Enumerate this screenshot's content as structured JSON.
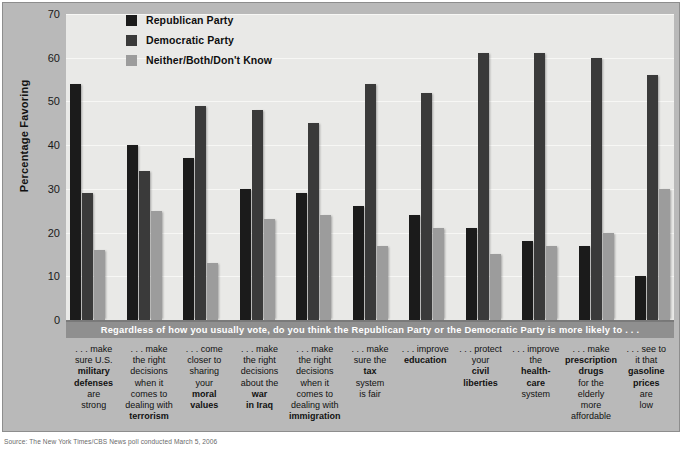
{
  "chart_data": {
    "type": "bar",
    "title": "",
    "question_banner": "Regardless of how you usually vote, do you think the Republican Party or the Democratic Party is more likely to . . .",
    "xlabel": "",
    "ylabel": "Percentage Favoring",
    "ylim": [
      0,
      70
    ],
    "yticks": [
      70,
      60,
      50,
      40,
      30,
      20,
      10,
      0
    ],
    "grid": true,
    "legend_position": "top-left-inside",
    "categories": [
      "...make sure U.S. military defenses are strong",
      "...make the right decisions when it comes to dealing with terrorism",
      "...come closer to sharing your moral values",
      "...make the right decisions about the war in Iraq",
      "...make the right decisions when it comes to dealing with immigration",
      "...make sure the tax system is fair",
      "...improve education",
      "...protect your civil liberties",
      "...improve the health-care system",
      "...make prescription drugs for the elderly more affordable",
      "...see to it that gasoline prices are low"
    ],
    "series": [
      {
        "name": "Republican Party",
        "color": "#1b1b1b",
        "values": [
          54,
          40,
          37,
          30,
          29,
          26,
          24,
          21,
          18,
          17,
          10
        ]
      },
      {
        "name": "Democratic Party",
        "color": "#3a3a3a",
        "values": [
          29,
          34,
          49,
          48,
          45,
          54,
          52,
          61,
          61,
          60,
          56
        ]
      },
      {
        "name": "Neither/Both/Don't Know",
        "color": "#9c9c9c",
        "values": [
          16,
          25,
          13,
          23,
          24,
          17,
          21,
          15,
          17,
          20,
          30
        ]
      }
    ]
  },
  "legend": {
    "items": [
      {
        "label": "Republican Party",
        "color": "#1b1b1b"
      },
      {
        "label": "Democratic Party",
        "color": "#3a3a3a"
      },
      {
        "label": "Neither/Both/Don't Know",
        "color": "#9c9c9c"
      }
    ]
  },
  "axis": {
    "y_label": "Percentage Favoring",
    "y_ticks": [
      "70",
      "60",
      "50",
      "40",
      "30",
      "20",
      "10",
      "0"
    ]
  },
  "banner": {
    "text": "Regardless of how you usually vote, do you think the Republican Party or the Democratic Party is more likely to . . ."
  },
  "captions": [
    {
      "lines": [
        {
          "t": ". . . make",
          "b": false
        },
        {
          "t": "sure U.S.",
          "b": false
        },
        {
          "t": "military",
          "b": true
        },
        {
          "t": "defenses",
          "b": true
        },
        {
          "t": "are",
          "b": false
        },
        {
          "t": "strong",
          "b": false
        }
      ]
    },
    {
      "lines": [
        {
          "t": ". . . make",
          "b": false
        },
        {
          "t": "the right",
          "b": false
        },
        {
          "t": "decisions",
          "b": false
        },
        {
          "t": "when it",
          "b": false
        },
        {
          "t": "comes to",
          "b": false
        },
        {
          "t": "dealing with",
          "b": false
        },
        {
          "t": "terrorism",
          "b": true
        }
      ]
    },
    {
      "lines": [
        {
          "t": ". . . come",
          "b": false
        },
        {
          "t": "closer to",
          "b": false
        },
        {
          "t": "sharing",
          "b": false
        },
        {
          "t": "your",
          "b": false
        },
        {
          "t": "moral",
          "b": true
        },
        {
          "t": "values",
          "b": true
        }
      ]
    },
    {
      "lines": [
        {
          "t": ". . . make",
          "b": false
        },
        {
          "t": "the right",
          "b": false
        },
        {
          "t": "decisions",
          "b": false
        },
        {
          "t": "about the",
          "b": false
        },
        {
          "t": "war",
          "b": true
        },
        {
          "t": "in Iraq",
          "b": true
        }
      ]
    },
    {
      "lines": [
        {
          "t": ". . . make",
          "b": false
        },
        {
          "t": "the right",
          "b": false
        },
        {
          "t": "decisions",
          "b": false
        },
        {
          "t": "when it",
          "b": false
        },
        {
          "t": "comes to",
          "b": false
        },
        {
          "t": "dealing with",
          "b": false
        },
        {
          "t": "immigration",
          "b": true
        }
      ]
    },
    {
      "lines": [
        {
          "t": ". . . make",
          "b": false
        },
        {
          "t": "sure the",
          "b": false
        },
        {
          "t": "tax",
          "b": true
        },
        {
          "t": "system",
          "b": false
        },
        {
          "t": "is fair",
          "b": false
        }
      ]
    },
    {
      "lines": [
        {
          "t": ". . . improve",
          "b": false
        },
        {
          "t": "education",
          "b": true
        }
      ]
    },
    {
      "lines": [
        {
          "t": ". . . protect",
          "b": false
        },
        {
          "t": "your",
          "b": false
        },
        {
          "t": "civil",
          "b": true
        },
        {
          "t": "liberties",
          "b": true
        }
      ]
    },
    {
      "lines": [
        {
          "t": ". . . improve",
          "b": false
        },
        {
          "t": "the",
          "b": false
        },
        {
          "t": "health-",
          "b": true
        },
        {
          "t": "care",
          "b": true
        },
        {
          "t": "system",
          "b": false
        }
      ]
    },
    {
      "lines": [
        {
          "t": ". . . make",
          "b": false
        },
        {
          "t": "prescription",
          "b": true
        },
        {
          "t": "drugs",
          "b": true
        },
        {
          "t": "for the elderly",
          "b": false
        },
        {
          "t": "more",
          "b": false
        },
        {
          "t": "affordable",
          "b": false
        }
      ]
    },
    {
      "lines": [
        {
          "t": ". . . see to",
          "b": false
        },
        {
          "t": "it that",
          "b": false
        },
        {
          "t": "gasoline",
          "b": true
        },
        {
          "t": "prices",
          "b": true
        },
        {
          "t": "are",
          "b": false
        },
        {
          "t": "low",
          "b": false
        }
      ]
    }
  ],
  "source": {
    "text": "Source: The New York Times/CBS News poll conducted March 5, 2006"
  },
  "colors": {
    "panel_bg": "#b9b9b9",
    "plot_bg": "#e9e9e7",
    "banner_bg": "#8f8f8f",
    "republican": "#1b1b1b",
    "democratic": "#3a3a3a",
    "neither": "#9c9c9c"
  }
}
